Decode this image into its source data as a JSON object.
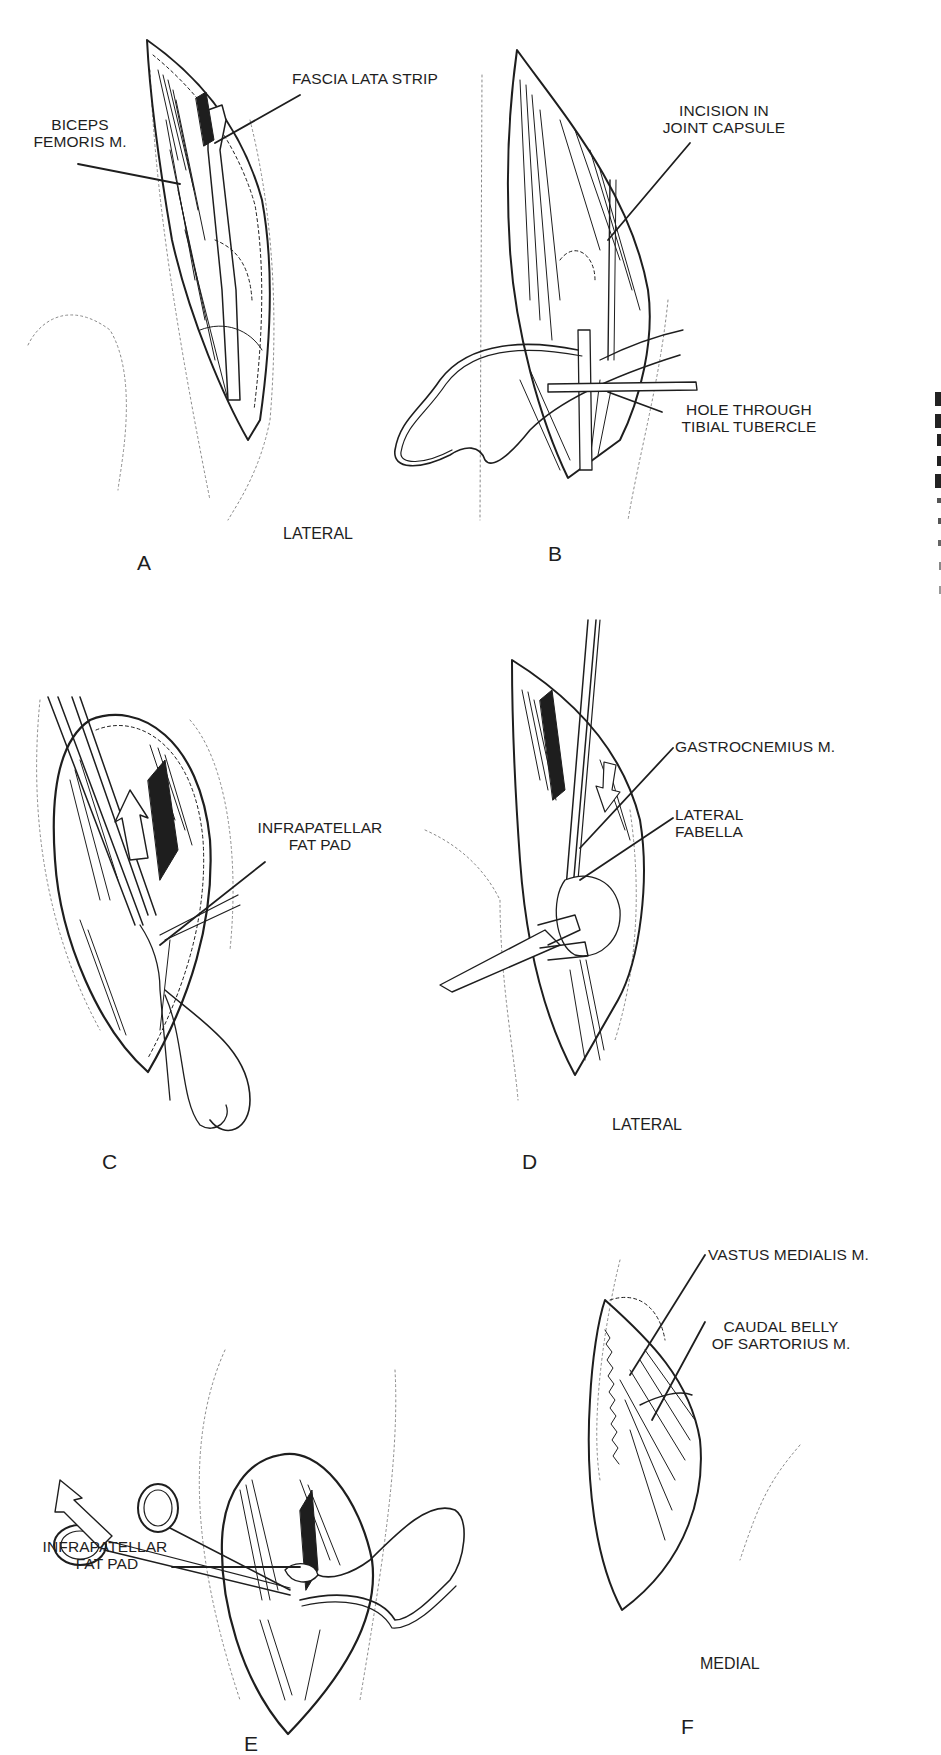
{
  "figure": {
    "panels": [
      {
        "id": "A",
        "letter": "A",
        "view": "LATERAL",
        "labels": [
          {
            "lines": [
              "BICEPS",
              "FEMORIS M."
            ]
          },
          {
            "lines": [
              "FASCIA LATA STRIP"
            ]
          }
        ]
      },
      {
        "id": "B",
        "letter": "B",
        "labels": [
          {
            "lines": [
              "INCISION IN",
              "JOINT CAPSULE"
            ]
          },
          {
            "lines": [
              "HOLE THROUGH",
              "TIBIAL TUBERCLE"
            ]
          }
        ]
      },
      {
        "id": "C",
        "letter": "C",
        "labels": [
          {
            "lines": [
              "INFRAPATELLAR",
              "FAT PAD"
            ]
          }
        ]
      },
      {
        "id": "D",
        "letter": "D",
        "view": "LATERAL",
        "labels": [
          {
            "lines": [
              "GASTROCNEMIUS M."
            ]
          },
          {
            "lines": [
              "LATERAL",
              "FABELLA"
            ]
          }
        ]
      },
      {
        "id": "E",
        "letter": "E",
        "labels": [
          {
            "lines": [
              "INFRAPATELLAR",
              "FAT PAD"
            ]
          }
        ]
      },
      {
        "id": "F",
        "letter": "F",
        "view": "MEDIAL",
        "labels": [
          {
            "lines": [
              "VASTUS MEDIALIS M."
            ]
          },
          {
            "lines": [
              "CAUDAL BELLY",
              "OF SARTORIUS M."
            ]
          }
        ]
      }
    ]
  },
  "colors": {
    "ink": "#1e1e1e",
    "background": "#ffffff",
    "dotted_outline": "#8a8a8a"
  }
}
